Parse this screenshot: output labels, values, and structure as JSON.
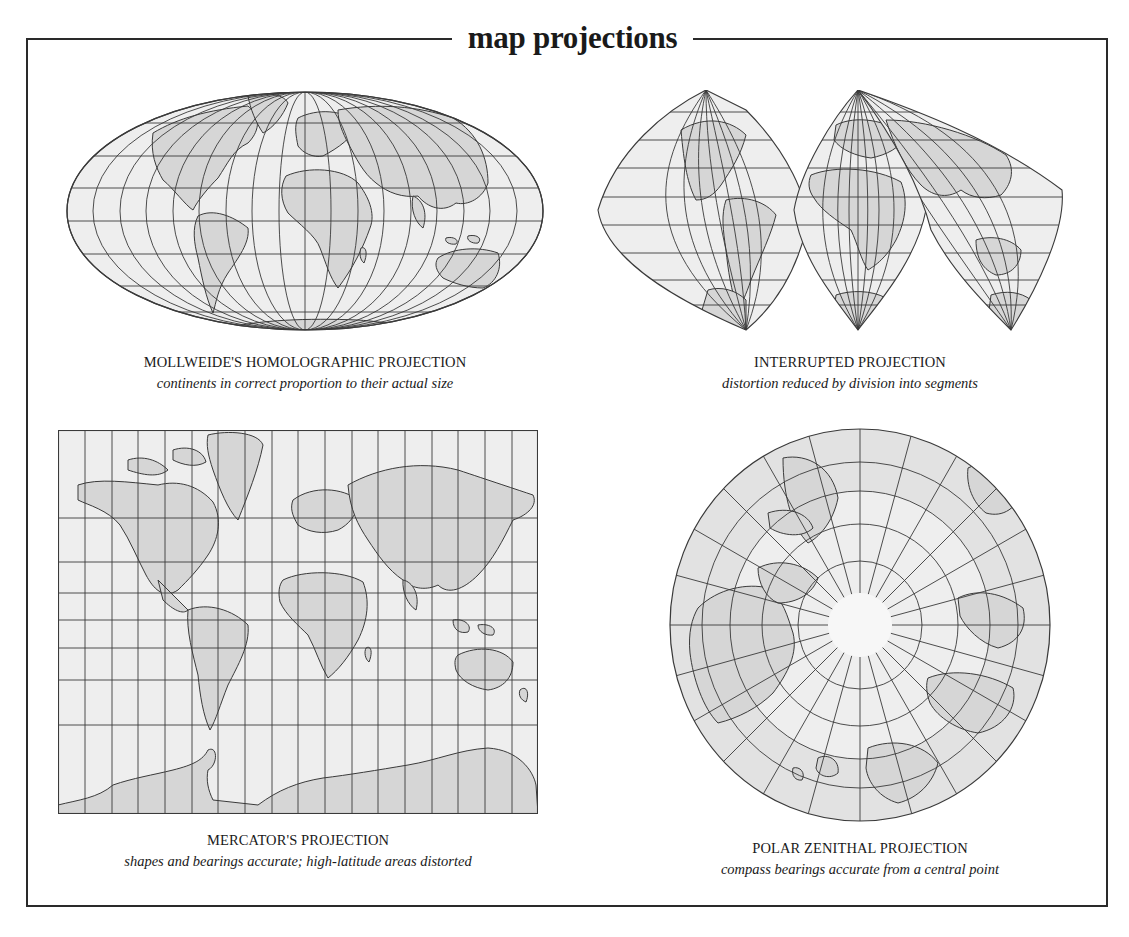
{
  "title": "map projections",
  "colors": {
    "ocean": "#eeeeee",
    "land": "#d6d6d6",
    "grid": "#3a3a3a",
    "frame": "#2a2a2a"
  },
  "projections": [
    {
      "id": "mollweide",
      "name": "MOLLWEIDE'S HOMOLOGRAPHIC PROJECTION",
      "description": "continents in correct proportion to their actual size"
    },
    {
      "id": "interrupted",
      "name": "INTERRUPTED PROJECTION",
      "description": "distortion reduced by division into segments"
    },
    {
      "id": "mercator",
      "name": "MERCATOR'S PROJECTION",
      "description": "shapes and bearings accurate; high-latitude areas distorted"
    },
    {
      "id": "polar",
      "name": "POLAR ZENITHAL PROJECTION",
      "description": "compass bearings accurate from a central point"
    }
  ]
}
